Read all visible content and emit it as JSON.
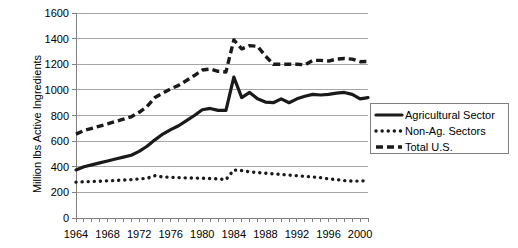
{
  "chart_data": {
    "type": "line",
    "title": "",
    "xlabel": "",
    "ylabel": "Million lbs Active Ingredients",
    "xlim": [
      1964,
      2001
    ],
    "ylim": [
      0,
      1600
    ],
    "grid": true,
    "legend_position": "right",
    "y_ticks": [
      "0",
      "200",
      "400",
      "600",
      "800",
      "1000",
      "1200",
      "1400",
      "1600"
    ],
    "x_tick_labels": [
      "1964",
      "1968",
      "1972",
      "1976",
      "1980",
      "1984",
      "1988",
      "1992",
      "1996",
      "2000"
    ],
    "x_minor_tick_interval": 1,
    "x": [
      1964,
      1965,
      1966,
      1967,
      1968,
      1969,
      1970,
      1971,
      1972,
      1973,
      1974,
      1975,
      1976,
      1977,
      1978,
      1979,
      1980,
      1981,
      1982,
      1983,
      1984,
      1985,
      1986,
      1987,
      1988,
      1989,
      1990,
      1991,
      1992,
      1993,
      1994,
      1995,
      1996,
      1997,
      1998,
      1999,
      2000,
      2001
    ],
    "series": [
      {
        "name": "Agricultural Sector",
        "style": "solid",
        "color": "#1a1a1a",
        "values": [
          375,
          400,
          415,
          430,
          445,
          460,
          475,
          490,
          520,
          560,
          610,
          655,
          690,
          720,
          760,
          800,
          845,
          855,
          840,
          840,
          1100,
          940,
          980,
          930,
          905,
          900,
          930,
          900,
          930,
          950,
          965,
          960,
          965,
          975,
          980,
          965,
          930,
          940
        ]
      },
      {
        "name": "Non-Ag. Sectors",
        "style": "dotted",
        "color": "#1a1a1a",
        "values": [
          280,
          283,
          285,
          287,
          290,
          293,
          296,
          300,
          305,
          310,
          330,
          320,
          318,
          315,
          313,
          312,
          310,
          308,
          305,
          300,
          375,
          370,
          360,
          355,
          350,
          345,
          340,
          335,
          330,
          325,
          320,
          315,
          305,
          300,
          292,
          288,
          288,
          292
        ]
      },
      {
        "name": "Total U.S.",
        "style": "dashed",
        "color": "#1a1a1a",
        "values": [
          655,
          683,
          700,
          717,
          735,
          753,
          771,
          790,
          825,
          870,
          940,
          975,
          1008,
          1035,
          1073,
          1112,
          1155,
          1163,
          1145,
          1140,
          1390,
          1320,
          1345,
          1340,
          1265,
          1200,
          1200,
          1200,
          1200,
          1195,
          1230,
          1230,
          1225,
          1240,
          1245,
          1240,
          1220,
          1222
        ]
      }
    ]
  },
  "legend": {
    "items": [
      {
        "label": "Agricultural Sector",
        "style": "solid"
      },
      {
        "label": "Non-Ag. Sectors",
        "style": "dotted"
      },
      {
        "label": "Total U.S.",
        "style": "dashed"
      }
    ]
  }
}
